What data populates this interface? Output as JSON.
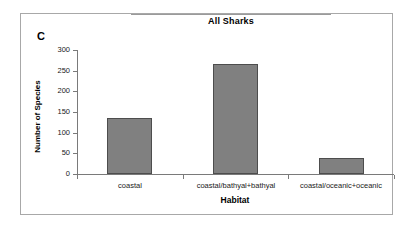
{
  "figure": {
    "panel_label": "C",
    "title": "All Sharks"
  },
  "chart_data": {
    "type": "bar",
    "title": "All Sharks",
    "panel": "C",
    "categories": [
      "coastal",
      "coastal/bathyal+bathyal",
      "coastal/oceanic+oceanic"
    ],
    "values": [
      135,
      265,
      38
    ],
    "xlabel": "Habitat",
    "ylabel": "Number of Species",
    "ylim": [
      0,
      300
    ],
    "ytick_values": [
      0,
      50,
      100,
      150,
      200,
      250,
      300
    ],
    "ytick_labels": [
      "0",
      "50",
      "100",
      "150",
      "200",
      "250",
      "300"
    ],
    "grid": false,
    "legend": false,
    "bar_color": "#808080",
    "bar_edge_color": "#4d4d4d",
    "axis_color": "#7a7a7a"
  }
}
